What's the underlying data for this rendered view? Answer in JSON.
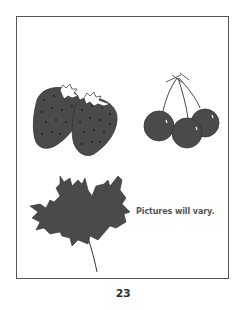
{
  "page": {
    "caption": "Pictures will vary.",
    "page_number": "23"
  },
  "illustrations": [
    {
      "name": "strawberries",
      "count": 2
    },
    {
      "name": "cherries",
      "count": 3
    },
    {
      "name": "maple-leaf",
      "count": 1
    }
  ],
  "colors": {
    "fill": "#4a4a4a",
    "border": "#555555",
    "background": "#ffffff"
  }
}
